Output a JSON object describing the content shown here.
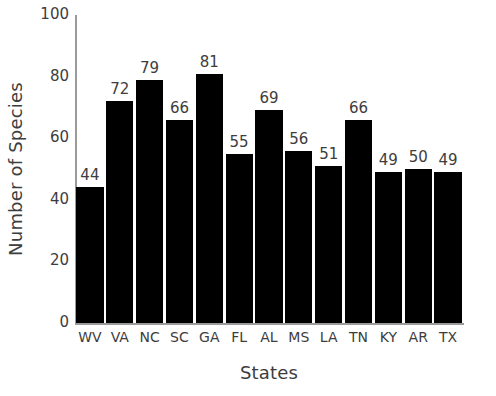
{
  "chart_data": {
    "type": "bar",
    "title": "",
    "xlabel": "States",
    "ylabel": "Number of Species",
    "categories": [
      "WV",
      "VA",
      "NC",
      "SC",
      "GA",
      "FL",
      "AL",
      "MS",
      "LA",
      "TN",
      "KY",
      "AR",
      "TX"
    ],
    "values": [
      44,
      72,
      79,
      66,
      81,
      55,
      69,
      56,
      51,
      66,
      49,
      50,
      49
    ],
    "value_labels": [
      "44",
      "72",
      "79",
      "66",
      "81",
      "55",
      "69",
      "56",
      "51",
      "66",
      "49",
      "50",
      "49"
    ],
    "ylim": [
      0,
      100
    ],
    "yticks": [
      0,
      20,
      40,
      60,
      80,
      100
    ],
    "ytick_labels": [
      "0",
      "20",
      "40",
      "60",
      "80",
      "100"
    ],
    "grid": false,
    "legend": false,
    "bar_color": "#000000",
    "axis_color": "#9a9a9a",
    "text_color": "#3d3d3d",
    "background_color": "#ffffff",
    "data_labels_shown": true
  }
}
